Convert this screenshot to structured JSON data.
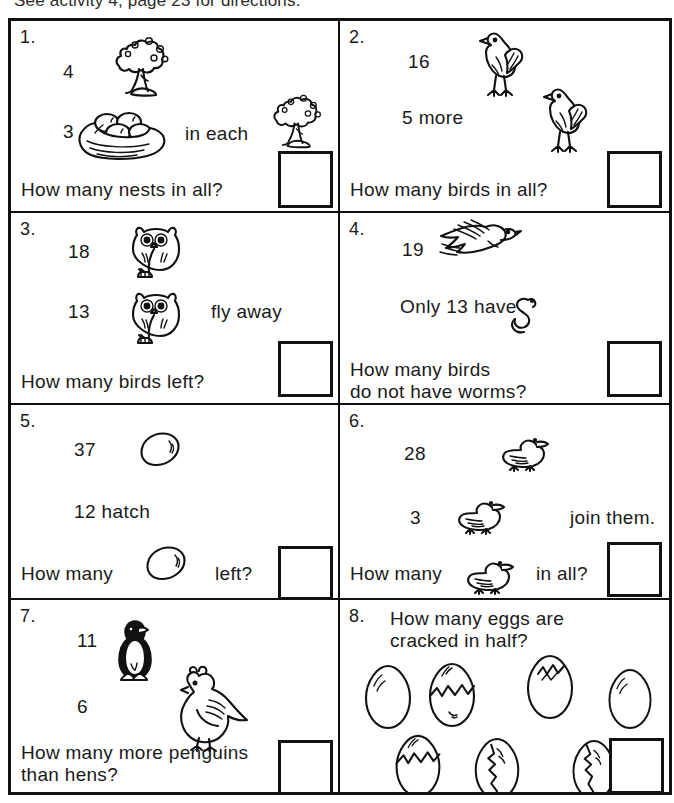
{
  "page": {
    "header_note": "See activity 4, page 23 for directions."
  },
  "problems": [
    {
      "number": "1.",
      "top_value": "4",
      "second_value": "3",
      "middle_label": "in each",
      "question": "How many nests in all?",
      "answer": "",
      "icons": [
        "tree-icon",
        "nest-icon",
        "tree-icon"
      ]
    },
    {
      "number": "2.",
      "top_value": "16",
      "second_value": "5 more",
      "middle_label": "",
      "question": "How many birds in all?",
      "answer": "",
      "icons": [
        "chicken-icon",
        "chicken-icon"
      ]
    },
    {
      "number": "3.",
      "top_value": "18",
      "second_value": "13",
      "middle_label": "fly away",
      "question": "How many birds left?",
      "answer": "",
      "icons": [
        "owl-icon",
        "owl-icon"
      ]
    },
    {
      "number": "4.",
      "top_value": "19",
      "second_value": "Only 13 have",
      "middle_label": "",
      "question": "How many birds\ndo not have worms?",
      "answer": "",
      "icons": [
        "flying-bird-icon",
        "worm-icon"
      ]
    },
    {
      "number": "5.",
      "top_value": "37",
      "second_value": "12 hatch",
      "middle_label": "",
      "question_pre": "How many",
      "question_post": "left?",
      "question": "How many  left?",
      "answer": "",
      "icons": [
        "egg-icon",
        "egg-icon"
      ]
    },
    {
      "number": "6.",
      "top_value": "28",
      "second_value": "3",
      "middle_label": "join them.",
      "question_pre": "How many",
      "question_post": "in all?",
      "question": "How many  in all?",
      "answer": "",
      "icons": [
        "duck-icon",
        "duck-icon",
        "duck-icon"
      ]
    },
    {
      "number": "7.",
      "top_value": "11",
      "second_value": "6",
      "middle_label": "",
      "question": "How many more penguins\nthan hens?",
      "answer": "",
      "icons": [
        "penguin-icon",
        "hen-icon"
      ]
    },
    {
      "number": "8.",
      "question": "How many eggs are\ncracked in half?",
      "answer": "",
      "eggs_row1": [
        "egg-plain-icon",
        "egg-cracked-half-icon",
        "egg-cracked-top-icon",
        "egg-plain-icon"
      ],
      "eggs_row2": [
        "egg-cracked-half-icon",
        "egg-zigzag-crack-icon",
        "egg-zigzag-crack-icon"
      ]
    }
  ],
  "colors": {
    "ink": "#111111",
    "paper": "#ffffff"
  }
}
